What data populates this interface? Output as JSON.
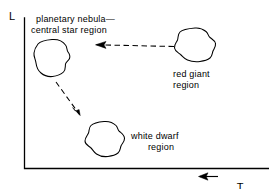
{
  "figure": {
    "type": "schematic-diagram",
    "background_color": "#ffffff",
    "ink_color": "#000000"
  },
  "axes": {
    "y_label": "L",
    "x_label_symbol": "T",
    "x_label_subscript": "s",
    "x_direction_arrow": "left-pointing-arrow",
    "x_axis_note": "temperature increases to the left"
  },
  "regions": [
    {
      "id": "planetary-nebula",
      "label_line1": "planetary nebula—",
      "label_line2": "central star region",
      "label_align": "left"
    },
    {
      "id": "red-giant",
      "label_line1": "red giant",
      "label_line2": "region",
      "label_align": "left"
    },
    {
      "id": "white-dwarf",
      "label_line1": "white dwarf",
      "label_line2": "region",
      "label_align": "center"
    }
  ],
  "arrows": [
    {
      "id": "red-giant-to-planetary-nebula",
      "style": "dashed",
      "direction": "leftward"
    },
    {
      "id": "planetary-nebula-to-white-dwarf",
      "style": "dashed",
      "direction": "down-right"
    }
  ]
}
